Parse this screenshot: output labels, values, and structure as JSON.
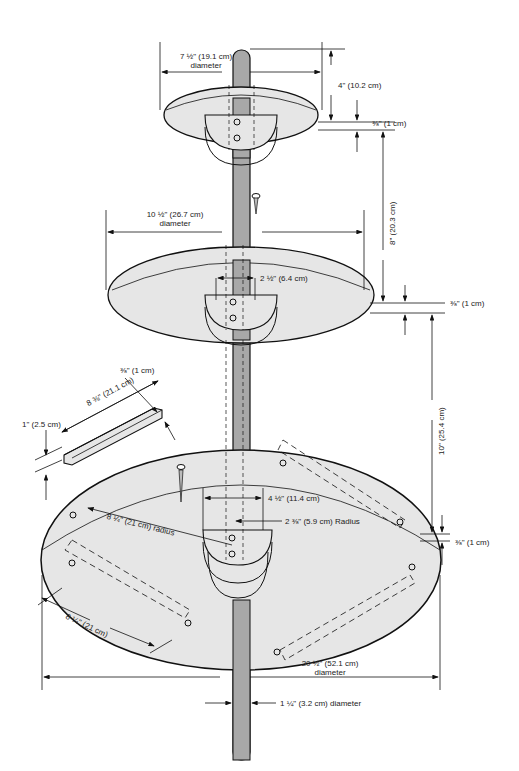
{
  "colors": {
    "shelf_fill": "#e6e6e6",
    "pole_fill": "#a8a8a8",
    "line": "#111111",
    "background": "#ffffff"
  },
  "labels": {
    "top_diameter": "7 ½\" (19.1 cm)",
    "top_diameter_sub": "diameter",
    "top_pole_height": "4\" (10.2 cm)",
    "top_thickness": "⅜\" (1 cm)",
    "gap_top_middle": "8\" (20.3 cm)",
    "middle_diameter": "10 ½\" (26.7 cm)",
    "middle_diameter_sub": "diameter",
    "middle_bracket_width": "2 ½\" (6.4 cm)",
    "middle_thickness": "⅜\" (1 cm)",
    "gap_middle_bottom": "10\" (25.4 cm)",
    "cleat_thickness": "⅜\" (1 cm)",
    "cleat_length": "8 ⅜\" (21.1 cm)",
    "cleat_height": "1\" (2.5 cm)",
    "bottom_bracket_width": "4 ½\" (11.4 cm)",
    "bottom_hub_radius": "2 ⅜\" (5.9 cm) Radius",
    "bottom_radius": "8 ¼\" (21 cm) radius",
    "bottom_thickness": "⅜\" (1 cm)",
    "bottom_chord": "8 ¼\" (21 cm)",
    "bottom_diameter": "20 ½\" (52.1 cm)",
    "bottom_diameter_sub": "diameter",
    "pole_diameter": "1 ¼\" (3.2 cm) diameter"
  }
}
